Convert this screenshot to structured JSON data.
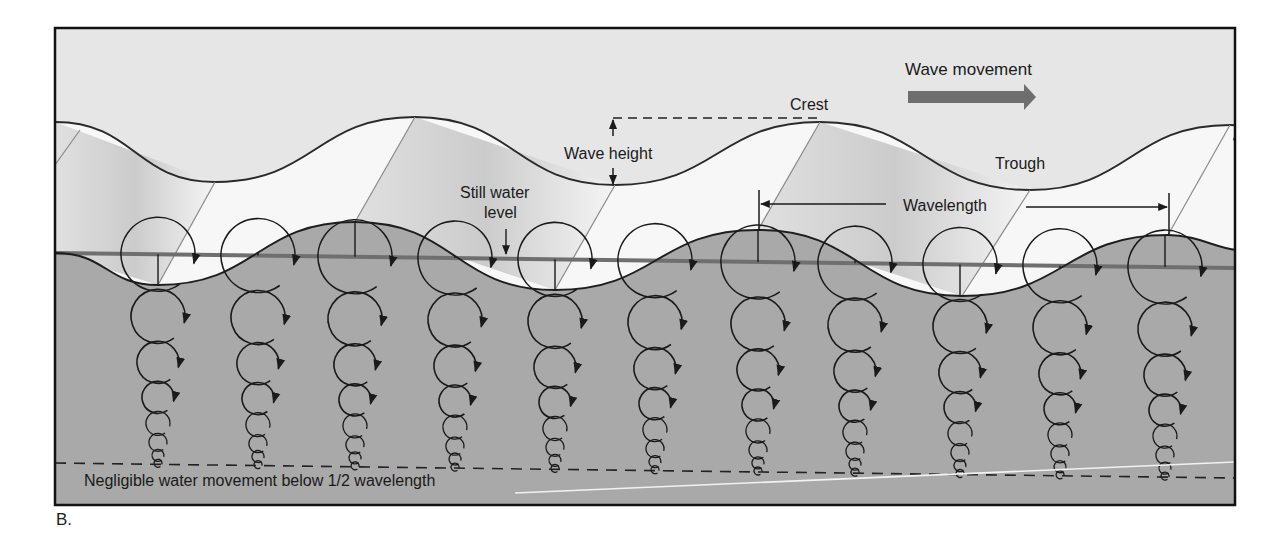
{
  "figure": {
    "panel_label": "B.",
    "frame": {
      "x": 55,
      "y": 28,
      "width": 1180,
      "height": 477
    },
    "colors": {
      "sky": "#e6e6e6",
      "surface_light": "#ffffff",
      "surface_shade": "#c4c4c4",
      "water": "#a9a9a9",
      "still_water_line": "#6f6f6f",
      "wave_arrow": "#6e6e6e",
      "ink": "#1a1a1a",
      "frame": "#111111",
      "bottom_highlight": "#f2f2f2"
    }
  },
  "labels": {
    "wave_movement": "Wave movement",
    "crest": "Crest",
    "trough": "Trough",
    "wave_height": "Wave height",
    "still_water_line1": "Still water",
    "still_water_line2": "level",
    "wavelength": "Wavelength",
    "negligible": "Negligible water movement below 1/2 wavelength"
  },
  "geometry": {
    "back_wave": {
      "crests": [
        [
          415,
          117
        ],
        [
          820,
          122
        ],
        [
          1230,
          125
        ]
      ],
      "troughs": [
        [
          215,
          182
        ],
        [
          615,
          185
        ],
        [
          1030,
          190
        ]
      ],
      "left_start": [
        55,
        122
      ]
    },
    "front_wave": {
      "crests": [
        [
          355,
          222
        ],
        [
          758,
          230
        ],
        [
          1168,
          235
        ]
      ],
      "troughs": [
        [
          158,
          285
        ],
        [
          555,
          290
        ],
        [
          962,
          296
        ]
      ],
      "left_start": [
        55,
        253
      ]
    },
    "still_water_line": {
      "x1": 55,
      "y1": 253,
      "x2": 1235,
      "y2": 268
    },
    "negligible_line": {
      "x1": 55,
      "y1": 463,
      "x2": 1235,
      "y2": 478
    },
    "bottom_highlight": {
      "x1": 515,
      "y1": 493,
      "x2": 1235,
      "y2": 462
    },
    "orbit_columns_x": [
      158,
      258,
      355,
      455,
      555,
      655,
      758,
      855,
      960,
      1060,
      1165
    ],
    "orbit_radii": [
      37,
      27,
      21,
      16,
      12,
      9,
      6,
      4
    ]
  }
}
